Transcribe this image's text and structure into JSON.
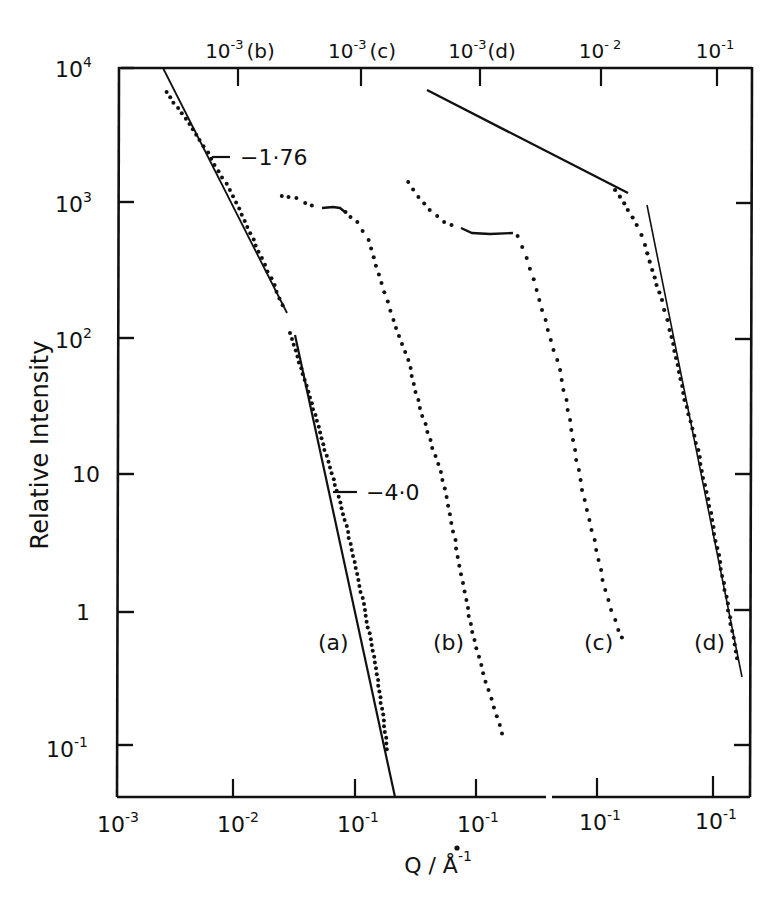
{
  "chart_data": {
    "type": "scatter",
    "title": "",
    "xlabel": "Q / Å⁻¹",
    "ylabel": "Relative Intensity",
    "yscale": "log",
    "xscale": "log",
    "ylim": [
      0.05,
      10000
    ],
    "y_ticks": [
      "10^4",
      "10^3",
      "10^2",
      "10",
      "1",
      "10^-1"
    ],
    "x_ticks_bottom": [
      "10^-3",
      "10^-2",
      "10^-1",
      "10^-1",
      "10^-1",
      "10^-1"
    ],
    "x_ticks_top": [
      "10^-3 (b)",
      "10^-3 (c)",
      "10^-3 (d)",
      "10^-2",
      "10^-1"
    ],
    "grid": false,
    "annotations": [
      {
        "text": "-1·76",
        "target": "curve (a) low-Q fit slope"
      },
      {
        "text": "-4·0",
        "target": "curve (a) high-Q fit slope"
      },
      {
        "text": "(a)"
      },
      {
        "text": "(b)"
      },
      {
        "text": "(c)"
      },
      {
        "text": "(d)"
      }
    ],
    "series": [
      {
        "name": "(a)",
        "style": "points + fitted lines",
        "x": [
          0.0025,
          0.004,
          0.006,
          0.01,
          0.015,
          0.02,
          0.026,
          0.03,
          0.04,
          0.06,
          0.08,
          0.1,
          0.13,
          0.17
        ],
        "y": [
          6500,
          4200,
          2300,
          1100,
          520,
          300,
          170,
          120,
          45,
          9,
          3,
          1.2,
          0.4,
          0.12
        ],
        "fits": [
          {
            "slope": -1.76,
            "range": [
              0.0023,
              0.028
            ]
          },
          {
            "slope": -4.0,
            "range": [
              0.03,
              0.2
            ]
          }
        ]
      },
      {
        "name": "(b)",
        "style": "points",
        "x": [
          0.002,
          0.003,
          0.004,
          0.006,
          0.008,
          0.012,
          0.02,
          0.03,
          0.05,
          0.07,
          0.1,
          0.15
        ],
        "y": [
          1100,
          950,
          900,
          900,
          850,
          450,
          150,
          45,
          8,
          1.5,
          0.4,
          0.1
        ]
      },
      {
        "name": "(c)",
        "style": "points",
        "x": [
          0.002,
          0.003,
          0.004,
          0.006,
          0.008,
          0.01,
          0.015,
          0.02,
          0.03,
          0.05,
          0.08,
          0.12,
          0.17
        ],
        "y": [
          1400,
          900,
          650,
          580,
          580,
          560,
          350,
          150,
          50,
          12,
          3,
          1,
          0.55
        ]
      },
      {
        "name": "(d)",
        "style": "points + fitted lines",
        "x": [
          0.004,
          0.006,
          0.01,
          0.015,
          0.02,
          0.03,
          0.05,
          0.08,
          0.12,
          0.17
        ],
        "y": [
          1200,
          800,
          400,
          250,
          120,
          40,
          9,
          2.5,
          0.8,
          0.3
        ],
        "fits": [
          {
            "note": "shallow low-Q line",
            "range": [
              0.0006,
              0.016
            ]
          },
          {
            "note": "steep high-Q line",
            "range": [
              0.028,
              0.18
            ]
          }
        ]
      }
    ]
  },
  "axes": {
    "ylabel": "Relative Intensity",
    "xlabel_main": "Q / Å",
    "xlabel_exp": "-1",
    "y_ticks": [
      {
        "base": "10",
        "exp": "4"
      },
      {
        "base": "10",
        "exp": "3"
      },
      {
        "base": "10",
        "exp": "2"
      },
      {
        "base": "10",
        "exp": ""
      },
      {
        "base": "1",
        "exp": ""
      },
      {
        "base": "10",
        "exp": "-1"
      }
    ],
    "x_bottom": [
      {
        "base": "10",
        "exp": "-3"
      },
      {
        "base": "10",
        "exp": "-2"
      },
      {
        "base": "10",
        "exp": "-1"
      },
      {
        "base": "10",
        "exp": "-1"
      },
      {
        "base": "10",
        "exp": "-1"
      },
      {
        "base": "10",
        "exp": "-1"
      }
    ],
    "x_top": [
      {
        "base": "10",
        "exp": "-3",
        "suffix": "(b)"
      },
      {
        "base": "10",
        "exp": "-3",
        "suffix": "(c)"
      },
      {
        "base": "10",
        "exp": "-3",
        "suffix": "(d)"
      },
      {
        "base": "10",
        "exp": "- 2",
        "suffix": ""
      },
      {
        "base": "10",
        "exp": "-1",
        "suffix": ""
      }
    ]
  },
  "annotations": {
    "slope1": "−1·76",
    "slope2": "−4·0",
    "a": "(a)",
    "b": "(b)",
    "c": "(c)",
    "d": "(d)"
  },
  "colors": {
    "ink": "#111111",
    "background": "#ffffff"
  }
}
